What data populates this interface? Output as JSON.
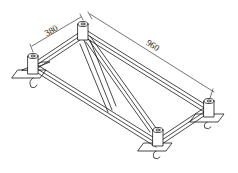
{
  "diagram": {
    "type": "isometric technical drawing",
    "dimensions": {
      "width": {
        "label": "380"
      },
      "length": {
        "label": "960"
      }
    },
    "colors": {
      "line": "#1a1a1a",
      "background": "#ffffff"
    }
  }
}
